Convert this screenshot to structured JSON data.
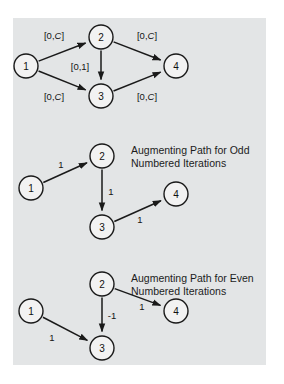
{
  "figure": {
    "panel": {
      "x": 13,
      "y": 18,
      "width": 253,
      "height": 347,
      "background_color": "#e3e5e6"
    },
    "colors": {
      "node_fill": "#f2f2f2",
      "node_stroke": "#1a1a1a",
      "edge_stroke": "#1a1a1a",
      "text": "#141414",
      "page_background": "#ffffff"
    },
    "diagrams": [
      {
        "id": "capacity-network",
        "nodes": [
          {
            "id": "n1",
            "label": "1",
            "cx": 26,
            "cy": 66,
            "r": 12
          },
          {
            "id": "n2",
            "label": "2",
            "cx": 101,
            "cy": 37,
            "r": 12
          },
          {
            "id": "n3",
            "label": "3",
            "cx": 101,
            "cy": 96,
            "r": 12
          },
          {
            "id": "n4",
            "label": "4",
            "cx": 176,
            "cy": 66,
            "r": 12
          }
        ],
        "edges": [
          {
            "id": "e12",
            "from": "n1",
            "to": "n2",
            "label": "[0,C]",
            "label_x": 54,
            "label_y": 35,
            "label_italic_tail": true
          },
          {
            "id": "e13",
            "from": "n1",
            "to": "n3",
            "label": "[0,C]",
            "label_x": 54,
            "label_y": 96,
            "label_italic_tail": true
          },
          {
            "id": "e23",
            "from": "n2",
            "to": "n3",
            "label": "[0,1]",
            "label_x": 80,
            "label_y": 66,
            "label_italic_tail": false
          },
          {
            "id": "e24",
            "from": "n2",
            "to": "n4",
            "label": "[0,C]",
            "label_x": 147,
            "label_y": 35,
            "label_italic_tail": true
          },
          {
            "id": "e34",
            "from": "n3",
            "to": "n4",
            "label": "[0,C]",
            "label_x": 147,
            "label_y": 96,
            "label_italic_tail": true
          }
        ],
        "caption": null
      },
      {
        "id": "odd-iteration-path",
        "nodes": [
          {
            "id": "n1",
            "label": "1",
            "cx": 31,
            "cy": 188,
            "r": 12
          },
          {
            "id": "n2",
            "label": "2",
            "cx": 102,
            "cy": 156,
            "r": 12
          },
          {
            "id": "n3",
            "label": "3",
            "cx": 102,
            "cy": 227,
            "r": 12
          },
          {
            "id": "n4",
            "label": "4",
            "cx": 176,
            "cy": 194,
            "r": 12
          }
        ],
        "edges": [
          {
            "id": "e12",
            "from": "n1",
            "to": "n2",
            "label": "1",
            "label_x": 61,
            "label_y": 164,
            "label_italic_tail": false
          },
          {
            "id": "e23",
            "from": "n2",
            "to": "n3",
            "label": "1",
            "label_x": 111,
            "label_y": 191,
            "label_italic_tail": false
          },
          {
            "id": "e34",
            "from": "n3",
            "to": "n4",
            "label": "1",
            "label_x": 140,
            "label_y": 219,
            "label_italic_tail": false
          }
        ],
        "caption": {
          "lines": [
            "Augmenting Path for Odd",
            "Numbered Iterations"
          ],
          "x": 131,
          "y": 150,
          "line_height": 13
        }
      },
      {
        "id": "even-iteration-path",
        "nodes": [
          {
            "id": "n1",
            "label": "1",
            "cx": 31,
            "cy": 311,
            "r": 12
          },
          {
            "id": "n2",
            "label": "2",
            "cx": 102,
            "cy": 284,
            "r": 12
          },
          {
            "id": "n3",
            "label": "3",
            "cx": 102,
            "cy": 348,
            "r": 12
          },
          {
            "id": "n4",
            "label": "4",
            "cx": 176,
            "cy": 311,
            "r": 12
          }
        ],
        "edges": [
          {
            "id": "e13",
            "from": "n1",
            "to": "n3",
            "label": "1",
            "label_x": 52,
            "label_y": 337,
            "label_italic_tail": false
          },
          {
            "id": "e23",
            "from": "n2",
            "to": "n3",
            "label": "-1",
            "label_x": 112,
            "label_y": 315,
            "label_italic_tail": false
          },
          {
            "id": "e24",
            "from": "n2",
            "to": "n4",
            "label": "1",
            "label_x": 142,
            "label_y": 306,
            "label_italic_tail": false
          }
        ],
        "caption": {
          "lines": [
            "Augmenting Path for Even",
            "Numbered Iterations"
          ],
          "x": 131,
          "y": 278,
          "line_height": 13
        }
      }
    ]
  }
}
